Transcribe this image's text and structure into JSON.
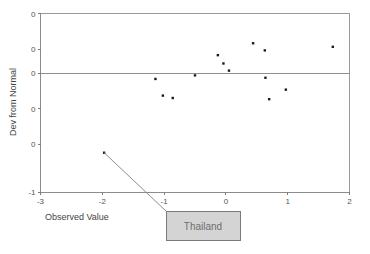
{
  "chart_data": {
    "type": "scatter",
    "title": "",
    "subtitle": "",
    "xlabel": "Observed Value",
    "ylabel": "Dev from Normal",
    "xlim": [
      -3,
      2
    ],
    "ylim": [
      -1.0,
      0.5
    ],
    "xticks": [
      -3,
      -2,
      -1,
      0,
      1,
      2
    ],
    "xticklabels": [
      "-3",
      "-2",
      "-1",
      "0",
      "1",
      "2"
    ],
    "yticks": [
      0.5,
      0.2,
      0.0,
      -0.3,
      -0.6,
      -1.0
    ],
    "yticklabels": [
      "0",
      "0",
      "0",
      "0",
      "0",
      "-1"
    ],
    "grid": false,
    "legend": null,
    "reference_line": {
      "orientation": "horizontal",
      "value": 0.0
    },
    "points": [
      {
        "x": -1.97,
        "y": -0.67,
        "label": "Thailand"
      },
      {
        "x": -1.14,
        "y": -0.05
      },
      {
        "x": -1.02,
        "y": -0.19
      },
      {
        "x": -0.86,
        "y": -0.21
      },
      {
        "x": -0.5,
        "y": -0.02
      },
      {
        "x": -0.13,
        "y": 0.15
      },
      {
        "x": -0.04,
        "y": 0.08
      },
      {
        "x": 0.05,
        "y": 0.02
      },
      {
        "x": 0.44,
        "y": 0.25
      },
      {
        "x": 0.63,
        "y": 0.19
      },
      {
        "x": 0.64,
        "y": -0.04
      },
      {
        "x": 0.7,
        "y": -0.22
      },
      {
        "x": 0.97,
        "y": -0.14
      },
      {
        "x": 1.73,
        "y": 0.22
      }
    ],
    "annotations": [
      {
        "text": "Thailand",
        "points_to": {
          "x": -1.97,
          "y": -0.67
        }
      }
    ],
    "colors": {
      "marker": "#1c1c1c",
      "axis": "#8c8c8c",
      "reference_line": "#8f8f8f",
      "callout_fill": "#d4d4d4",
      "callout_stroke": "#7b7b7b",
      "callout_text": "#6e6e6e",
      "background": "#ffffff"
    }
  }
}
